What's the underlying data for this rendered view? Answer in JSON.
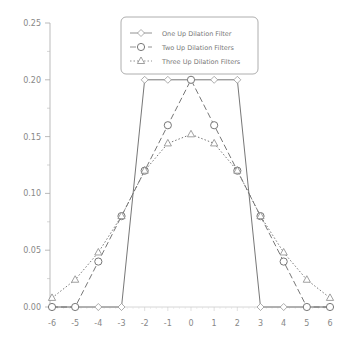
{
  "chart_data": {
    "type": "line",
    "title": "",
    "xlabel": "",
    "ylabel": "",
    "xlim": [
      -6,
      6
    ],
    "ylim": [
      0,
      0.25
    ],
    "grid": false,
    "legend_position": "top-center",
    "x": [
      -6,
      -5,
      -4,
      -3,
      -2,
      -1,
      0,
      1,
      2,
      3,
      4,
      5,
      6
    ],
    "x_ticks": [
      "-6",
      "-5",
      "-4",
      "-3",
      "-2",
      "-1",
      "0",
      "1",
      "2",
      "3",
      "4",
      "5",
      "6"
    ],
    "y_ticks": [
      "0.00",
      "0.05",
      "0.10",
      "0.15",
      "0.20",
      "0.25"
    ],
    "series": [
      {
        "name": "One Up Dilation Filter",
        "marker": "diamond",
        "line": "solid",
        "values": [
          0,
          0,
          0,
          0,
          0.2,
          0.2,
          0.2,
          0.2,
          0.2,
          0,
          0,
          0,
          0
        ]
      },
      {
        "name": "Two Up Dilation Filters",
        "marker": "circle",
        "line": "dashed",
        "values": [
          0,
          0,
          0.04,
          0.08,
          0.12,
          0.16,
          0.2,
          0.16,
          0.12,
          0.08,
          0.04,
          0,
          0
        ]
      },
      {
        "name": "Three Up Dilation Filters",
        "marker": "triangle",
        "line": "dotted",
        "values": [
          0.008,
          0.024,
          0.048,
          0.08,
          0.12,
          0.144,
          0.152,
          0.144,
          0.12,
          0.08,
          0.048,
          0.024,
          0.008
        ]
      }
    ]
  }
}
